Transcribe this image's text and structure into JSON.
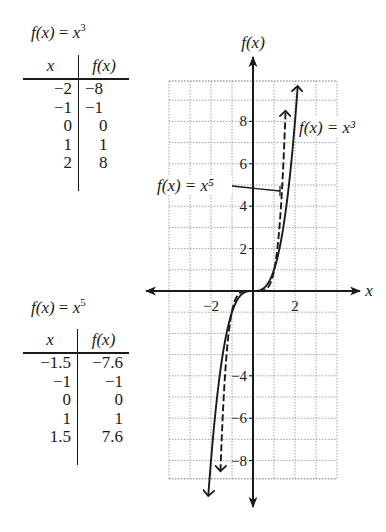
{
  "tables": [
    {
      "title_lhs": "f(x)",
      "title_rhs_base": "x",
      "title_rhs_exp": "3",
      "headers": [
        "x",
        "f(x)"
      ],
      "rows": [
        [
          "−2",
          "−8"
        ],
        [
          "−1",
          "−1"
        ],
        [
          "0",
          "0"
        ],
        [
          "1",
          "1"
        ],
        [
          "2",
          "8"
        ]
      ]
    },
    {
      "title_lhs": "f(x)",
      "title_rhs_base": "x",
      "title_rhs_exp": "5",
      "headers": [
        "x",
        "f(x)"
      ],
      "rows": [
        [
          "−1.5",
          "−7.6"
        ],
        [
          "−1",
          "−1"
        ],
        [
          "0",
          "0"
        ],
        [
          "1",
          "1"
        ],
        [
          "1.5",
          "7.6"
        ]
      ]
    }
  ],
  "graph": {
    "y_axis_label": "f(x)",
    "x_axis_label": "x",
    "x_tick_labels": [
      {
        "value": -2,
        "text": "−2"
      },
      {
        "value": 2,
        "text": "2"
      }
    ],
    "y_tick_labels": [
      {
        "value": 8,
        "text": "8"
      },
      {
        "value": 6,
        "text": "6"
      },
      {
        "value": 4,
        "text": "4"
      },
      {
        "value": 2,
        "text": "2"
      },
      {
        "value": -4,
        "text": "−4"
      },
      {
        "value": -6,
        "text": "−6"
      },
      {
        "value": -8,
        "text": "−8"
      }
    ],
    "curve_labels": {
      "cubic": "f(x) = x³",
      "quintic": "f(x) = x⁵"
    }
  },
  "chart_data": {
    "type": "line",
    "title": "",
    "xlabel": "x",
    "ylabel": "f(x)",
    "xlim": [
      -4,
      4
    ],
    "ylim": [
      -9,
      10
    ],
    "grid": true,
    "x_ticks": [
      -2,
      2
    ],
    "y_ticks": [
      -8,
      -6,
      -4,
      2,
      4,
      6,
      8
    ],
    "series": [
      {
        "name": "f(x) = x^3",
        "style": "solid",
        "x": [
          -2,
          -1,
          0,
          1,
          2
        ],
        "y": [
          -8,
          -1,
          0,
          1,
          8
        ]
      },
      {
        "name": "f(x) = x^5",
        "style": "dashed",
        "x": [
          -1.5,
          -1,
          0,
          1,
          1.5
        ],
        "y": [
          -7.6,
          -1,
          0,
          1,
          7.6
        ]
      }
    ],
    "annotations": [
      "f(x) = x^3",
      "f(x) = x^5"
    ]
  }
}
